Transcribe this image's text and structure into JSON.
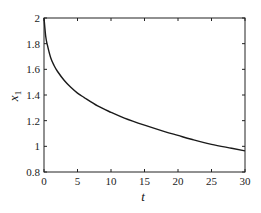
{
  "chart_data": {
    "type": "line",
    "title": "",
    "xlabel": "t",
    "ylabel": "x",
    "ylabel_subscript": "1",
    "xlim": [
      0,
      30
    ],
    "ylim": [
      0.8,
      2
    ],
    "xticks": [
      0,
      5,
      10,
      15,
      20,
      25,
      30
    ],
    "yticks": [
      0.8,
      1,
      1.2,
      1.4,
      1.6,
      1.8,
      2
    ],
    "xtick_labels": [
      "0",
      "5",
      "10",
      "15",
      "20",
      "25",
      "30"
    ],
    "ytick_labels": [
      "0.8",
      "1",
      "1.2",
      "1.4",
      "1.6",
      "1.8",
      "2"
    ],
    "grid": false,
    "legend": null,
    "series": [
      {
        "name": "x1",
        "color": "#1a1a1a",
        "x": [
          0,
          0.25,
          0.5,
          1,
          1.5,
          2,
          3,
          4,
          5,
          6,
          8,
          10,
          12,
          15,
          18,
          20,
          22,
          25,
          28,
          30
        ],
        "values": [
          2.0,
          1.86,
          1.79,
          1.69,
          1.63,
          1.585,
          1.515,
          1.46,
          1.415,
          1.38,
          1.315,
          1.265,
          1.22,
          1.165,
          1.115,
          1.085,
          1.055,
          1.015,
          0.985,
          0.965
        ]
      }
    ]
  },
  "colors": {
    "axis": "#222222",
    "line": "#1a1a1a",
    "background": "#ffffff"
  }
}
